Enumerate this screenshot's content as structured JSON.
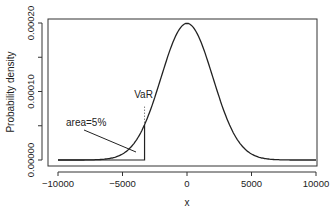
{
  "chart_data": {
    "type": "line",
    "title": "",
    "xlabel": "x",
    "ylabel": "Probability density",
    "xlim": [
      -10000,
      10000
    ],
    "ylim": [
      0,
      0.0002
    ],
    "x_ticks": [
      "-10000",
      "-5000",
      "0",
      "5000",
      "10000"
    ],
    "y_ticks": [
      "0.00000",
      "0.00010",
      "0.00020"
    ],
    "grid": false,
    "legend": null,
    "series": [
      {
        "name": "Normal density",
        "mean": 0,
        "sd": 2000,
        "x": [
          -10000,
          -8000,
          -6000,
          -5000,
          -4000,
          -3290,
          -3000,
          -2000,
          -1000,
          0,
          1000,
          2000,
          3000,
          4000,
          5000,
          6000,
          8000,
          10000
        ],
        "values": [
          0.0,
          7e-07,
          8.9e-06,
          3.5e-05,
          2.7e-05,
          5.17e-05,
          6.48e-05,
          0.000121,
          0.000176,
          0.0001995,
          0.000176,
          0.000121,
          6.48e-05,
          2.7e-05,
          8.8e-06,
          2.2e-06,
          1e-07,
          0.0
        ]
      }
    ],
    "annotations": [
      {
        "text": "VaR",
        "x": -3290,
        "note": "dotted vertical line above shaded tail boundary"
      },
      {
        "text": "area=5%",
        "note": "pointer line to left-tail area below VaR"
      }
    ]
  }
}
